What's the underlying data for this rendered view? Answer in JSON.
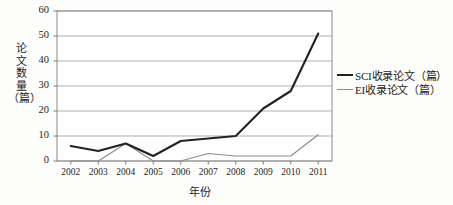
{
  "chart_data": {
    "type": "line",
    "title": "",
    "xlabel": "年份",
    "ylabel": "论文数量（篇）",
    "ylabel_chars": [
      "论",
      "文",
      "数",
      "量",
      "（篇）"
    ],
    "categories": [
      "2002",
      "2003",
      "2004",
      "2005",
      "2006",
      "2007",
      "2008",
      "2009",
      "2010",
      "2011"
    ],
    "x": [
      2002,
      2003,
      2004,
      2005,
      2006,
      2007,
      2008,
      2009,
      2010,
      2011
    ],
    "ylim": [
      0,
      60
    ],
    "yticks": [
      "0",
      "10",
      "20",
      "30",
      "40",
      "50",
      "60"
    ],
    "ytick_values": [
      0,
      10,
      20,
      30,
      40,
      50,
      60
    ],
    "grid": "horizontal",
    "legend_position": "right",
    "series": [
      {
        "name": "SCI收录论文（篇）",
        "color": "#222222",
        "width": 2.1,
        "values": [
          6,
          4,
          7,
          2,
          8,
          9,
          10,
          21,
          28,
          51
        ]
      },
      {
        "name": "EI收录论文（篇）",
        "color": "#8d8d8d",
        "width": 1.2,
        "values": [
          0,
          0,
          7,
          0,
          0,
          3,
          2,
          2,
          2,
          10.5
        ]
      }
    ]
  },
  "plot": {
    "left": 57,
    "right": 332,
    "top": 11,
    "bottom": 161,
    "border_color": "#8a8a8a",
    "grid_color": "#a6a6a6",
    "background": "#ffffff"
  }
}
